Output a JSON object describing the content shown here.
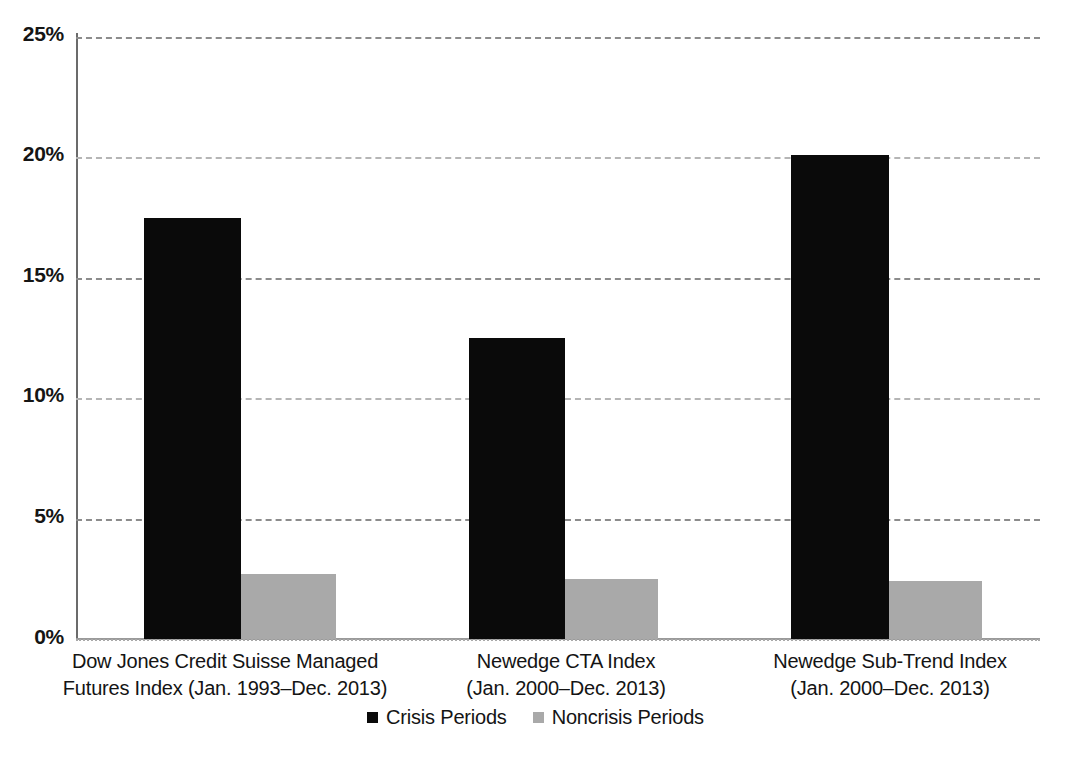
{
  "chart_data": {
    "type": "bar",
    "title": "",
    "xlabel": "",
    "ylabel": "",
    "ylim": [
      0,
      25
    ],
    "y_tick_values": [
      0,
      5,
      10,
      15,
      20,
      25
    ],
    "y_tick_labels": [
      "0%",
      "5%",
      "10%",
      "15%",
      "20%",
      "25%"
    ],
    "grid": true,
    "legend_position": "bottom-center",
    "categories": [
      "Dow Jones Credit Suisse Managed Futures Index (Jan. 1993–Dec. 2013)",
      "Newedge CTA Index (Jan. 2000–Dec. 2013)",
      "Newedge Sub-Trend Index (Jan. 2000–Dec. 2013)"
    ],
    "category_lines": [
      [
        "Dow Jones Credit Suisse Managed",
        "Futures Index (Jan. 1993–Dec. 2013)"
      ],
      [
        "Newedge CTA Index",
        "(Jan. 2000–Dec. 2013)"
      ],
      [
        "Newedge Sub-Trend Index",
        "(Jan. 2000–Dec. 2013)"
      ]
    ],
    "series": [
      {
        "name": "Crisis Periods",
        "color": "#0a0a0a",
        "values": [
          17.5,
          12.5,
          20.1
        ]
      },
      {
        "name": "Noncrisis Periods",
        "color": "#a9a9a9",
        "values": [
          2.7,
          2.5,
          2.4
        ]
      }
    ]
  },
  "axis": {
    "ticks": [
      {
        "label": "25%",
        "value": 25
      },
      {
        "label": "20%",
        "value": 20
      },
      {
        "label": "15%",
        "value": 15
      },
      {
        "label": "10%",
        "value": 10
      },
      {
        "label": "5%",
        "value": 5
      },
      {
        "label": "0%",
        "value": 0
      }
    ]
  },
  "categories": {
    "c0": {
      "line1": "Dow Jones Credit Suisse Managed",
      "line2": "Futures Index (Jan. 1993–Dec. 2013)"
    },
    "c1": {
      "line1": "Newedge CTA Index",
      "line2": "(Jan. 2000–Dec. 2013)"
    },
    "c2": {
      "line1": "Newedge Sub-Trend Index",
      "line2": "(Jan. 2000–Dec. 2013)"
    }
  },
  "legend": {
    "items": [
      {
        "label": "Crisis Periods",
        "color": "#0a0a0a"
      },
      {
        "label": "Noncrisis Periods",
        "color": "#a9a9a9"
      }
    ]
  }
}
